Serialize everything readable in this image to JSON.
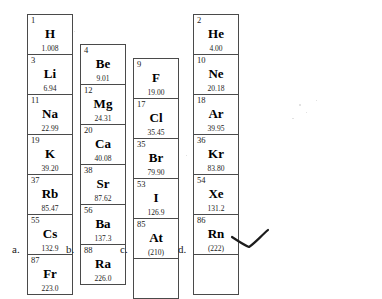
{
  "document": {
    "kind": "periodic-table-column-groups",
    "panel_labels": [
      "a.",
      "b.",
      "c.",
      "d."
    ],
    "annotation_mark": "handwritten-check-tick"
  },
  "columns": [
    {
      "label": "a.",
      "group_name": "alkali-metals",
      "elements": [
        {
          "number": "1",
          "symbol": "H",
          "mass": "1.008"
        },
        {
          "number": "3",
          "symbol": "Li",
          "mass": "6.94"
        },
        {
          "number": "11",
          "symbol": "Na",
          "mass": "22.99"
        },
        {
          "number": "19",
          "symbol": "K",
          "mass": "39.20"
        },
        {
          "number": "37",
          "symbol": "Rb",
          "mass": "85.47"
        },
        {
          "number": "55",
          "symbol": "Cs",
          "mass": "132.9"
        },
        {
          "number": "87",
          "symbol": "Fr",
          "mass": "223.0"
        }
      ]
    },
    {
      "label": "b.",
      "group_name": "alkaline-earth-metals",
      "elements": [
        {
          "number": "4",
          "symbol": "Be",
          "mass": "9.01"
        },
        {
          "number": "12",
          "symbol": "Mg",
          "mass": "24.31"
        },
        {
          "number": "20",
          "symbol": "Ca",
          "mass": "40.08"
        },
        {
          "number": "38",
          "symbol": "Sr",
          "mass": "87.62"
        },
        {
          "number": "56",
          "symbol": "Ba",
          "mass": "137.3"
        },
        {
          "number": "88",
          "symbol": "Ra",
          "mass": "226.0"
        }
      ]
    },
    {
      "label": "c.",
      "group_name": "halogens",
      "elements": [
        {
          "number": "9",
          "symbol": "F",
          "mass": "19.00"
        },
        {
          "number": "17",
          "symbol": "Cl",
          "mass": "35.45"
        },
        {
          "number": "35",
          "symbol": "Br",
          "mass": "79.90"
        },
        {
          "number": "53",
          "symbol": "I",
          "mass": "126.9"
        },
        {
          "number": "85",
          "symbol": "At",
          "mass": "(210)"
        },
        {
          "number": "",
          "symbol": "",
          "mass": ""
        }
      ]
    },
    {
      "label": "d.",
      "group_name": "noble-gases",
      "elements": [
        {
          "number": "2",
          "symbol": "He",
          "mass": "4.00"
        },
        {
          "number": "10",
          "symbol": "Ne",
          "mass": "20.18"
        },
        {
          "number": "18",
          "symbol": "Ar",
          "mass": "39.95"
        },
        {
          "number": "36",
          "symbol": "Kr",
          "mass": "83.80"
        },
        {
          "number": "54",
          "symbol": "Xe",
          "mass": "131.2"
        },
        {
          "number": "86",
          "symbol": "Rn",
          "mass": "(222)"
        },
        {
          "number": "",
          "symbol": "",
          "mass": ""
        }
      ]
    }
  ],
  "colors": {
    "border": "#4a4a4a",
    "text": "#1a1a1a",
    "background": "#ffffff",
    "ink": "#222222"
  }
}
